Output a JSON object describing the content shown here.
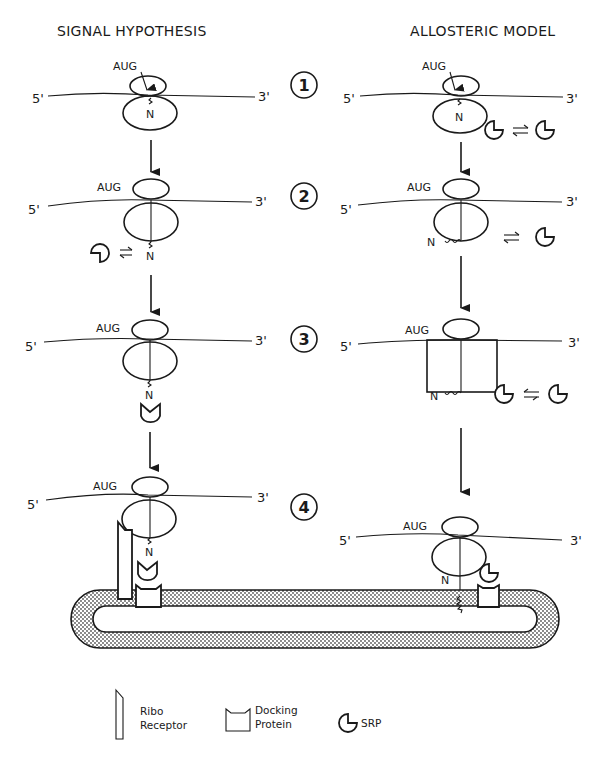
{
  "titles": {
    "left": "SIGNAL HYPOTHESIS",
    "right": "ALLOSTERIC MODEL"
  },
  "labels": {
    "five_prime": "5'",
    "three_prime": "3'",
    "start_codon": "AUG",
    "n_terminus": "N"
  },
  "steps": [
    "1",
    "2",
    "3",
    "4"
  ],
  "legend": {
    "ribo_receptor": [
      "Ribo",
      "Receptor"
    ],
    "docking_protein": [
      "Docking",
      "Protein"
    ],
    "srp": "SRP"
  },
  "colors": {
    "ink": "#1a1a1a",
    "background": "#ffffff",
    "membrane_fill": "#c8c8c8"
  }
}
